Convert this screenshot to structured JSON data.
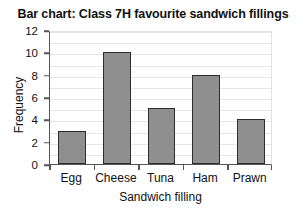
{
  "chart_data": {
    "type": "bar",
    "title": "Bar chart: Class 7H favourite sandwich fillings",
    "xlabel": "Sandwich filling",
    "ylabel": "Frequency",
    "categories": [
      "Egg",
      "Cheese",
      "Tuna",
      "Ham",
      "Prawn"
    ],
    "values": [
      3,
      10,
      5,
      8,
      4
    ],
    "ylim": [
      0,
      12
    ],
    "y_ticks": [
      0,
      2,
      4,
      6,
      8,
      10,
      12
    ],
    "y_tick_labels": [
      "0",
      "2",
      "4",
      "6",
      "8",
      "10",
      "12"
    ],
    "gridlines": {
      "horizontal": true,
      "step": 1,
      "color": "#e6e6e6"
    },
    "legend": null,
    "bar_fill_color": "#8f8f8f",
    "bar_edge_color": "#2e2e2e",
    "axis_color": "#555555",
    "background_color": "#ffffff"
  }
}
